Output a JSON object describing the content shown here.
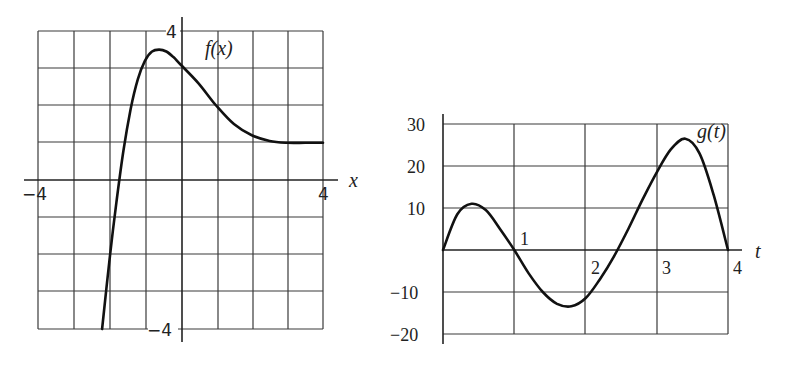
{
  "chart_data": [
    {
      "type": "line",
      "title": "",
      "function_label": "f(x)",
      "xlabel": "x",
      "ylabel": "",
      "xlim": [
        -4,
        4
      ],
      "ylim": [
        -4,
        4
      ],
      "grid": true,
      "grid_step": 1,
      "tick_labels": {
        "x_min": "−4",
        "x_max": "4",
        "y_max": "4",
        "y_min": "−4"
      },
      "series": [
        {
          "name": "f(x)",
          "x": [
            -2.2,
            -2.0,
            -1.8,
            -1.6,
            -1.4,
            -1.2,
            -1.0,
            -0.8,
            -0.6,
            -0.4,
            -0.2,
            0.0,
            0.5,
            1.0,
            1.5,
            2.0,
            2.5,
            3.0,
            3.5,
            4.0
          ],
          "y": [
            -4.0,
            -2.2,
            -0.6,
            0.8,
            1.9,
            2.7,
            3.2,
            3.45,
            3.5,
            3.45,
            3.3,
            3.1,
            2.6,
            2.0,
            1.5,
            1.2,
            1.05,
            1.0,
            1.0,
            1.0
          ]
        }
      ]
    },
    {
      "type": "line",
      "title": "",
      "function_label": "g(t)",
      "xlabel": "t",
      "ylabel": "",
      "xlim": [
        0,
        4
      ],
      "ylim": [
        -20,
        30
      ],
      "grid": true,
      "x_ticks": [
        "1",
        "2",
        "3",
        "4"
      ],
      "y_ticks": [
        "30",
        "20",
        "10",
        "−10",
        "−20"
      ],
      "series": [
        {
          "name": "g(t)",
          "x": [
            0.0,
            0.2,
            0.4,
            0.6,
            0.8,
            1.0,
            1.2,
            1.4,
            1.6,
            1.8,
            2.0,
            2.2,
            2.4,
            2.6,
            2.8,
            3.0,
            3.2,
            3.4,
            3.6,
            3.8,
            4.0
          ],
          "y": [
            0,
            8.5,
            11,
            9.5,
            5,
            0,
            -5.5,
            -10,
            -12.8,
            -13.4,
            -11.5,
            -7,
            -1.5,
            5,
            12,
            18.5,
            24,
            26.5,
            23,
            13,
            0
          ]
        }
      ]
    }
  ]
}
